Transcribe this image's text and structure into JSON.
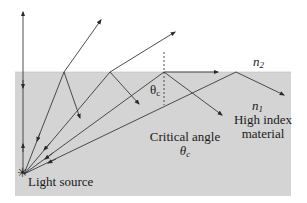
{
  "diagram": {
    "colors": {
      "background": "#ffffff",
      "material": "#d4d4d4",
      "ray": "#3a3a3a"
    },
    "labels": {
      "n2_base": "n",
      "n2_sub": "2",
      "n1_base": "n",
      "n1_sub": "1",
      "high_index_line1": "High index",
      "high_index_line2": "material",
      "critical_angle_line1": "Critical angle",
      "critical_angle_symbol_base": "θ",
      "critical_angle_symbol_sub": "c",
      "theta_c_normal_base": "θ",
      "theta_c_normal_sub": "c",
      "light_source": "Light source",
      "source_symbol": "✳"
    },
    "rays": [
      {
        "name": "ray-normal",
        "description": "perpendicular ray, passes straight through"
      },
      {
        "name": "ray-refracted-1",
        "description": "refracted out, partial reflection"
      },
      {
        "name": "ray-refracted-2",
        "description": "refracted out, partial reflection"
      },
      {
        "name": "ray-critical",
        "description": "at critical angle, grazes interface"
      },
      {
        "name": "ray-total-internal-reflection",
        "description": "beyond critical angle, totally reflected"
      }
    ]
  }
}
